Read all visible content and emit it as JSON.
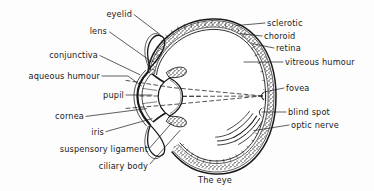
{
  "figure": {
    "caption": "The eye",
    "caption_pos": {
      "x": 215,
      "y": 180
    },
    "background_color": "#fdfdfd",
    "ink_color": "#1a1a1a"
  },
  "labels": {
    "left": [
      {
        "id": "eyelid",
        "text": "eyelid",
        "x": 132,
        "y": 14,
        "align": "right"
      },
      {
        "id": "lens",
        "text": "lens",
        "x": 107,
        "y": 31,
        "align": "right"
      },
      {
        "id": "conjunctiva",
        "text": "conjunctiva",
        "x": 98,
        "y": 55,
        "align": "right"
      },
      {
        "id": "aqueous-humour",
        "text": "aqueous humour",
        "x": 100,
        "y": 76,
        "align": "right"
      },
      {
        "id": "pupil",
        "text": "pupil",
        "x": 124,
        "y": 95,
        "align": "right"
      },
      {
        "id": "cornea",
        "text": "cornea",
        "x": 84,
        "y": 116,
        "align": "right"
      },
      {
        "id": "iris",
        "text": "iris",
        "x": 104,
        "y": 132,
        "align": "right"
      },
      {
        "id": "suspensory-ligament",
        "text": "suspensory ligament",
        "x": 148,
        "y": 149,
        "align": "right"
      },
      {
        "id": "ciliary-body",
        "text": "ciliary body",
        "x": 148,
        "y": 166,
        "align": "right"
      }
    ],
    "right": [
      {
        "id": "sclerotic",
        "text": "sclerotic",
        "x": 267,
        "y": 23,
        "align": "left"
      },
      {
        "id": "choroid",
        "text": "choroid",
        "x": 264,
        "y": 36,
        "align": "left"
      },
      {
        "id": "retina",
        "text": "retina",
        "x": 276,
        "y": 48,
        "align": "left"
      },
      {
        "id": "vitreous-humour",
        "text": "vitreous humour",
        "x": 285,
        "y": 62,
        "align": "left"
      },
      {
        "id": "fovea",
        "text": "fovea",
        "x": 286,
        "y": 88,
        "align": "left"
      },
      {
        "id": "blind-spot",
        "text": "blind spot",
        "x": 288,
        "y": 112,
        "align": "left"
      },
      {
        "id": "optic-nerve",
        "text": "optic nerve",
        "x": 291,
        "y": 125,
        "align": "left"
      }
    ]
  },
  "diagram": {
    "type": "anatomical-cross-section",
    "structures": [
      "eyelid",
      "lens",
      "conjunctiva",
      "aqueous humour",
      "pupil",
      "cornea",
      "iris",
      "suspensory ligament",
      "ciliary body",
      "sclerotic",
      "choroid",
      "retina",
      "vitreous humour",
      "fovea",
      "blind spot",
      "optic nerve"
    ],
    "light_rays": "dashed lines converging from lens to fovea"
  }
}
